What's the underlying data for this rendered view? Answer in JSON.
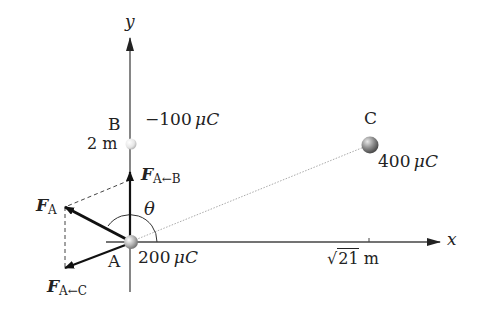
{
  "diagram": {
    "axes": {
      "x_label": "x",
      "y_label": "y",
      "x_tick_label_root": "21",
      "x_tick_label_prefix": "√",
      "x_tick_unit": "m",
      "y_tick_label": "2 m"
    },
    "charges": [
      {
        "name": "A",
        "value": "200",
        "unit": "μC",
        "position": [
          0,
          0
        ]
      },
      {
        "name": "B",
        "value": "−100",
        "unit": "μC",
        "position": [
          0,
          2
        ]
      },
      {
        "name": "C",
        "value": "400",
        "unit": "μC",
        "position": [
          "√21",
          2
        ]
      }
    ],
    "forces": {
      "f_ab": {
        "symbol": "F",
        "sub": "A←B"
      },
      "f_ac": {
        "symbol": "F",
        "sub": "A←C"
      },
      "f_a": {
        "symbol": "F",
        "sub": "A"
      }
    },
    "angle_label": "θ",
    "colors": {
      "axis": "#333333",
      "arrow": "#111111",
      "dashed": "#444444",
      "dotted_line": "#aaaaaa",
      "charge_a": "#b0b0b0",
      "charge_b": "#e8e8e8",
      "charge_c": "#8a8a8a"
    }
  }
}
